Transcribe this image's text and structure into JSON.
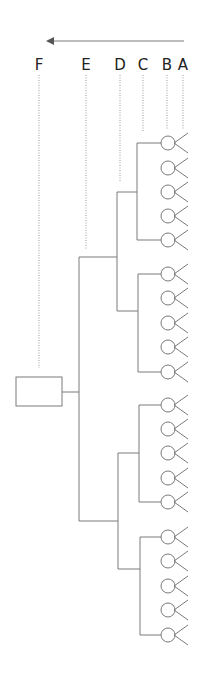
{
  "colors": {
    "line": "#7a7a7a",
    "dotted": "#9a9a9a",
    "text": "#222222",
    "arrow": "#555555"
  },
  "arrow": {
    "x1": 184,
    "x2": 46,
    "y": 41,
    "direction": "left"
  },
  "levels": [
    {
      "label": "F",
      "x": 39,
      "dot_end": 368
    },
    {
      "label": "E",
      "x": 86,
      "dot_end": 250
    },
    {
      "label": "D",
      "x": 120,
      "dot_end": 181
    },
    {
      "label": "C",
      "x": 143,
      "dot_end": 132
    },
    {
      "label": "B",
      "x": 167,
      "dot_end": 129
    },
    {
      "label": "A",
      "x": 183,
      "dot_end": 129
    }
  ],
  "root_box": {
    "x": 16,
    "y": 377,
    "w": 46,
    "h": 29
  },
  "tree": {
    "e_x": 79,
    "e_top": 257,
    "e_bottom": 521,
    "e_mid": 392,
    "d_branches": [
      {
        "x": 117,
        "top": 192,
        "bottom": 311,
        "e_join": 257
      },
      {
        "x": 118,
        "top": 453,
        "bottom": 569,
        "e_join": 521
      }
    ],
    "groups": [
      {
        "bracket_x": 137,
        "leaves": [
          143,
          168,
          192,
          216,
          240
        ]
      },
      {
        "bracket_x": 138,
        "leaves": [
          274,
          298,
          323,
          347,
          372
        ]
      },
      {
        "bracket_x": 139,
        "leaves": [
          405,
          429,
          453,
          478,
          502
        ]
      },
      {
        "bracket_x": 140,
        "leaves": [
          537,
          561,
          586,
          610,
          635
        ]
      }
    ]
  },
  "leaf_symbol": {
    "circle_cx": 168,
    "r": 7,
    "v_tip_x": 188,
    "v_spread": 10
  }
}
